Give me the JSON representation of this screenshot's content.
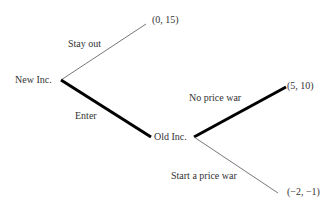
{
  "diagram": {
    "type": "game-tree",
    "nodes": {
      "root": {
        "label": "New Inc."
      },
      "second": {
        "label": "Old Inc."
      }
    },
    "branches": [
      {
        "label": "Stay out",
        "from": "New Inc.",
        "payoff": "(0, 15)",
        "bold": false
      },
      {
        "label": "Enter",
        "from": "New Inc.",
        "to": "Old Inc.",
        "bold": true
      },
      {
        "label": "No price war",
        "from": "Old Inc.",
        "payoff": "(5, 10)",
        "bold": true
      },
      {
        "label": "Start a price war",
        "from": "Old Inc.",
        "payoff": "(−2, −1)",
        "bold": false
      }
    ],
    "colors": {
      "line": "#000000",
      "thin_line": "#777777",
      "text": "#333333"
    }
  }
}
